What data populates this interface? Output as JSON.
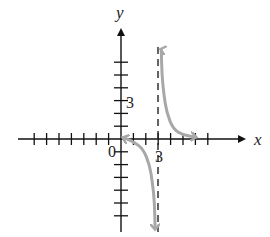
{
  "chart_data": {
    "type": "line",
    "title": "",
    "xlabel": "x",
    "ylabel": "y",
    "origin_label": "0",
    "x_tick_label": "3",
    "y_tick_label": "3",
    "xlim": [
      -8,
      9
    ],
    "ylim": [
      -7,
      9
    ],
    "x_ticks": [
      -7,
      -6,
      -5,
      -4,
      -3,
      -2,
      -1,
      1,
      2,
      3,
      4,
      5,
      6,
      7
    ],
    "y_ticks": [
      -6,
      -5,
      -4,
      -3,
      -2,
      -1,
      1,
      2,
      3,
      4,
      5,
      6
    ],
    "grid": false,
    "asymptote": {
      "type": "vertical",
      "x": 3,
      "style": "dashed"
    },
    "series": [
      {
        "name": "left branch",
        "color": "#a8a8a8",
        "points": [
          [
            0.2,
            0.1
          ],
          [
            1,
            -0.2
          ],
          [
            1.8,
            -0.8
          ],
          [
            2.3,
            -2
          ],
          [
            2.55,
            -3.5
          ],
          [
            2.7,
            -5
          ],
          [
            2.75,
            -7
          ]
        ]
      },
      {
        "name": "right branch",
        "color": "#a8a8a8",
        "points": [
          [
            3.25,
            7
          ],
          [
            3.3,
            5
          ],
          [
            3.45,
            3.5
          ],
          [
            3.7,
            2
          ],
          [
            4.2,
            0.8
          ],
          [
            5,
            0.3
          ],
          [
            6,
            0.15
          ]
        ]
      }
    ]
  }
}
